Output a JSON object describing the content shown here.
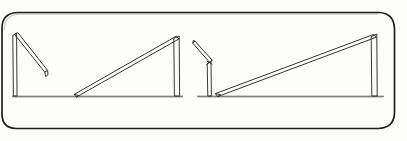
{
  "document": {
    "kind": "hand-drawn-sketch",
    "title": "Sequence of four pole-and-beam figures on ruled paper",
    "paper_color": "#fdfdfb",
    "ink_color": "#2b2b2b",
    "frame_border_color": "#1f1f1f",
    "ground_line_color": "#555555",
    "width_px": 407,
    "height_px": 141
  },
  "frame": {
    "label": "rounded-rectangle panel border",
    "x": 3,
    "y": 12,
    "width": 392,
    "height": 118,
    "corner_radius": 16,
    "stroke_width": 1.6,
    "color": "#1f1f1f"
  },
  "ground": {
    "label": "ground baseline",
    "y": 96,
    "segments": [
      {
        "x1": 12,
        "x2": 183
      },
      {
        "x1": 197,
        "x2": 384
      }
    ],
    "color": "#555555",
    "stroke_width": 1.1
  },
  "figures": [
    {
      "name": "figure-1-beam-down-right",
      "caption": "Tall post at left with beam hanging down to the right",
      "post": {
        "x_left": 12.5,
        "x_right": 16.5,
        "y_top": 34,
        "y_bottom": 96
      },
      "beam": {
        "from_x": 15,
        "from_y": 34,
        "to_x": 46,
        "to_y": 74,
        "thickness": 5,
        "angle_deg": 52
      }
    },
    {
      "name": "figure-2-beam-resting-left",
      "caption": "Post at right with long beam sloping down to the ground at left",
      "post": {
        "x_left": 174,
        "x_right": 179,
        "y_top": 36,
        "y_bottom": 96
      },
      "beam": {
        "from_x": 176,
        "from_y": 37,
        "to_x": 75,
        "to_y": 96,
        "thickness": 5,
        "angle_deg": 30
      }
    },
    {
      "name": "figure-3-beam-up-left",
      "caption": "Short post with beam angled upward to the left",
      "post": {
        "x_left": 207,
        "x_right": 211,
        "y_top": 62,
        "y_bottom": 96
      },
      "beam": {
        "from_x": 210,
        "from_y": 63,
        "to_x": 194,
        "to_y": 43,
        "thickness": 5,
        "angle_deg": 51
      }
    },
    {
      "name": "figure-4-beam-resting-left-wide",
      "caption": "Tall post at far right with very long beam sloping to the ground at left",
      "post": {
        "x_left": 371,
        "x_right": 377,
        "y_top": 34,
        "y_bottom": 96
      },
      "beam": {
        "from_x": 374,
        "from_y": 35,
        "to_x": 216,
        "to_y": 96,
        "thickness": 5,
        "angle_deg": 21
      }
    }
  ]
}
